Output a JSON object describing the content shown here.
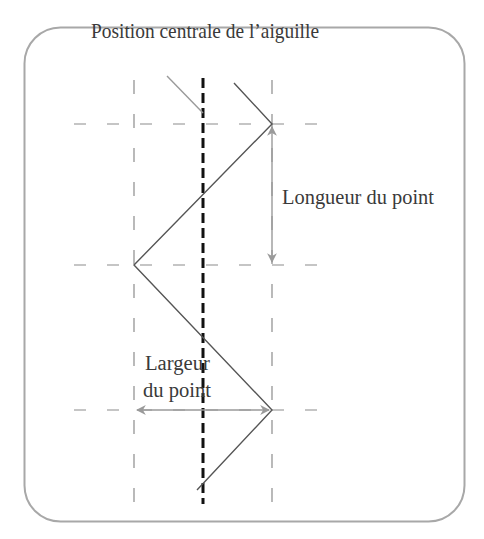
{
  "diagram": {
    "title": "Position centrale de l’aiguille",
    "labels": {
      "length": "Longueur du point",
      "width_line1": "Largeur",
      "width_line2": "du point"
    },
    "colors": {
      "frame": "#a8a8a8",
      "grid": "#8c8c8c",
      "needle_center": "#111111",
      "stitch": "#555555",
      "stitch_previous": "#9a9a9a",
      "arrows": "#9a9a9a",
      "text": "#3a3a3a"
    }
  }
}
